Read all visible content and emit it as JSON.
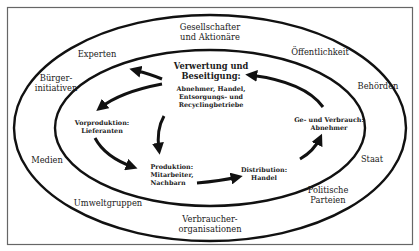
{
  "diagram": {
    "colors": {
      "line": "#111111",
      "frame": "#555555",
      "background": "#ffffff"
    },
    "outer_ring_labels": {
      "top": "Gesellschafter\nund Aktionäre",
      "top_left": "Experten",
      "top_right": "Öffentlichkeit",
      "left_upper": "Bürger-\ninitiativen",
      "right_upper": "Behörden",
      "left_lower": "Medien",
      "right_lower": "Staat",
      "bottom_left": "Umweltgruppen",
      "bottom_right": "Politische\nParteien",
      "bottom": "Verbraucher-\norganisationen"
    },
    "cycle": {
      "center": {
        "title": "Verwertung und\nBeseitigung:",
        "subtitle": "Abnehmer, Handel,\nEntsorgungs- und\nRecyclingbetriebe"
      },
      "stages": [
        {
          "id": "vorproduktion",
          "label": "Vorproduktion:\nLieferanten"
        },
        {
          "id": "produktion",
          "label": "Produktion:\nMitarbeiter,\nNachbarn"
        },
        {
          "id": "distribution",
          "label": "Distribution:\nHandel"
        },
        {
          "id": "verbrauch",
          "label": "Ge- und Verbrauch:\nAbnehmer"
        }
      ]
    }
  }
}
